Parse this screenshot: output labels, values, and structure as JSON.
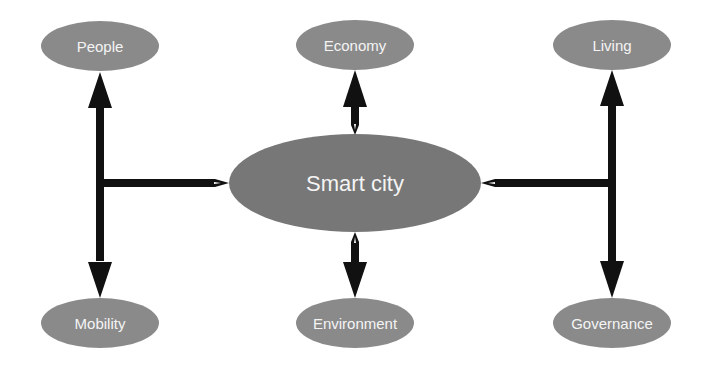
{
  "diagram": {
    "type": "hub-and-spoke concept map",
    "colors": {
      "node_fill": "#8a8a8a",
      "center_fill": "#777777",
      "label_text": "#f4f4f4",
      "connector": "#111111",
      "background": "#ffffff"
    },
    "center": {
      "id": "smart-city",
      "label": "Smart city"
    },
    "nodes": [
      {
        "id": "people",
        "label": "People"
      },
      {
        "id": "economy",
        "label": "Economy"
      },
      {
        "id": "living",
        "label": "Living"
      },
      {
        "id": "mobility",
        "label": "Mobility"
      },
      {
        "id": "environment",
        "label": "Environment"
      },
      {
        "id": "governance",
        "label": "Governance"
      }
    ],
    "edges": [
      {
        "from": "smart-city",
        "to": "people",
        "route": "left-branch-up"
      },
      {
        "from": "smart-city",
        "to": "mobility",
        "route": "left-branch-down"
      },
      {
        "from": "smart-city",
        "to": "economy",
        "route": "direct-up"
      },
      {
        "from": "smart-city",
        "to": "environment",
        "route": "direct-down"
      },
      {
        "from": "smart-city",
        "to": "living",
        "route": "right-branch-up"
      },
      {
        "from": "smart-city",
        "to": "governance",
        "route": "right-branch-down"
      }
    ]
  }
}
